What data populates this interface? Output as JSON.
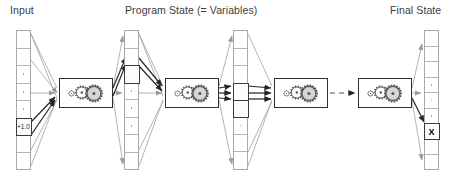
{
  "figure": {
    "type": "pipeline-diagram",
    "background_color": "#ffffff",
    "labels": [
      {
        "name": "input",
        "text": "Input",
        "x": 10,
        "y": 4
      },
      {
        "name": "program-state",
        "text": "Program State (= Variables)",
        "x": 125,
        "y": 4
      },
      {
        "name": "final-state",
        "text": "Final State",
        "x": 390,
        "y": 4
      }
    ],
    "colors": {
      "column_border": "#a8a8a8",
      "cell_divider": "#b4b4b4",
      "highlight_border": "#3a3a3a",
      "gearbox_border": "#2f2f2f",
      "wire_light": "#a0a0a0",
      "wire_dark": "#2b2b2b",
      "gear_fill": "#d6d6d6",
      "gear_stroke": "#555555",
      "text": "#3c3c3c"
    },
    "columns": [
      {
        "name": "input-vector",
        "x": 16,
        "y": 30,
        "width": 15,
        "height": 140,
        "cells": [
          {
            "kind": "plain",
            "text": ""
          },
          {
            "kind": "plain",
            "text": ""
          },
          {
            "kind": "dots",
            "text": ""
          },
          {
            "kind": "dots",
            "text": ""
          },
          {
            "kind": "dots",
            "text": ""
          },
          {
            "kind": "highlight",
            "text": "+1.0"
          },
          {
            "kind": "plain",
            "text": ""
          },
          {
            "kind": "plain",
            "text": ""
          }
        ]
      },
      {
        "name": "state-vector-1",
        "x": 124,
        "y": 30,
        "width": 15,
        "height": 140,
        "cells": [
          {
            "kind": "plain",
            "text": ""
          },
          {
            "kind": "plain",
            "text": ""
          },
          {
            "kind": "highlight",
            "text": ""
          },
          {
            "kind": "dots",
            "text": ""
          },
          {
            "kind": "dots",
            "text": ""
          },
          {
            "kind": "dots",
            "text": ""
          },
          {
            "kind": "plain",
            "text": ""
          },
          {
            "kind": "plain",
            "text": ""
          }
        ]
      },
      {
        "name": "state-vector-2",
        "x": 233,
        "y": 30,
        "width": 15,
        "height": 140,
        "cells": [
          {
            "kind": "plain",
            "text": ""
          },
          {
            "kind": "plain",
            "text": ""
          },
          {
            "kind": "plain",
            "text": ""
          },
          {
            "kind": "highlight",
            "text": ""
          },
          {
            "kind": "highlight",
            "text": ""
          },
          {
            "kind": "dots",
            "text": ""
          },
          {
            "kind": "plain",
            "text": ""
          },
          {
            "kind": "plain",
            "text": ""
          }
        ]
      },
      {
        "name": "final-state-vector",
        "x": 424,
        "y": 30,
        "width": 15,
        "height": 140,
        "cells": [
          {
            "kind": "plain",
            "text": ""
          },
          {
            "kind": "plain",
            "text": ""
          },
          {
            "kind": "plain",
            "text": ""
          },
          {
            "kind": "dots",
            "text": ""
          },
          {
            "kind": "dots",
            "text": ""
          },
          {
            "kind": "dots",
            "text": ""
          },
          {
            "kind": "highlight",
            "text": "X"
          },
          {
            "kind": "plain",
            "text": ""
          },
          {
            "kind": "plain",
            "text": ""
          }
        ]
      }
    ],
    "gearboxes": [
      {
        "name": "gearbox-step-1",
        "x": 59,
        "y": 78,
        "width": 54,
        "height": 30
      },
      {
        "name": "gearbox-step-2",
        "x": 165,
        "y": 78,
        "width": 54,
        "height": 30
      },
      {
        "name": "gearbox-step-3",
        "x": 274,
        "y": 78,
        "width": 54,
        "height": 30
      },
      {
        "name": "gearbox-step-4",
        "x": 358,
        "y": 78,
        "width": 54,
        "height": 30
      }
    ],
    "connector_note": "dashed arrow between gearbox-step-3 and gearbox-step-4 denotes omitted repeated steps"
  }
}
